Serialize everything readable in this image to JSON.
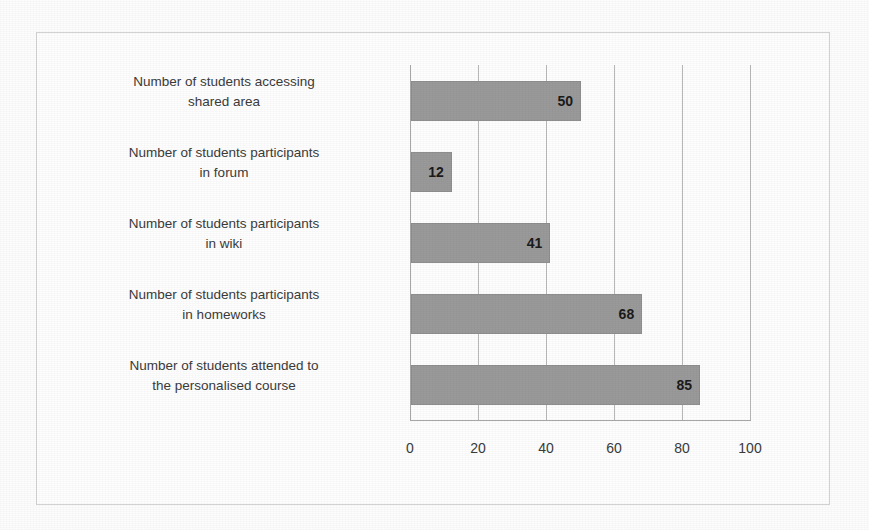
{
  "chart_data": {
    "type": "bar",
    "orientation": "horizontal",
    "title": "",
    "subtitle": "",
    "xlabel": "",
    "ylabel": "",
    "categories": [
      "Number of students accessing shared area",
      "Number of students participants in forum",
      "Number of students participants in wiki",
      "Number of students participants in homeworks",
      "Number of students attended to the personalised course"
    ],
    "category_lines": [
      [
        "Number of students accessing",
        "shared area"
      ],
      [
        "Number of students participants",
        "in forum"
      ],
      [
        "Number of students participants",
        "in wiki"
      ],
      [
        "Number of students participants",
        "in homeworks"
      ],
      [
        "Number of students attended to",
        "the personalised course"
      ]
    ],
    "values": [
      50,
      12,
      41,
      68,
      85
    ],
    "data_labels": [
      "50",
      "12",
      "41",
      "68",
      "85"
    ],
    "xlim": [
      0,
      100
    ],
    "xticks": [
      0,
      20,
      40,
      60,
      80,
      100
    ],
    "xtick_labels": [
      "0",
      "20",
      "40",
      "60",
      "80",
      "100"
    ],
    "grid": "vertical",
    "legend": "none",
    "series": [
      {
        "name": "",
        "values": [
          50,
          12,
          41,
          68,
          85
        ]
      }
    ]
  },
  "style": {
    "bar_fill": "#9a9a9a",
    "bar_border": "#8f8f8f",
    "gridline_color": "#b9b9b9",
    "axis_color": "#a8a8a8",
    "label_color": "#3b3b3b",
    "value_color": "#1b1b1b",
    "frame_border": "#d3d3d3",
    "background": "#fdfdfd"
  }
}
